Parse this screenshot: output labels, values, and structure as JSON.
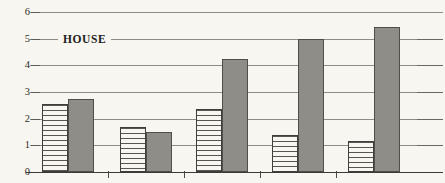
{
  "chart_data": {
    "type": "bar",
    "title": "",
    "subtitle": "",
    "xlabel": "",
    "ylabel": "",
    "ylim": [
      0,
      6
    ],
    "yticks": [
      0,
      1,
      2,
      3,
      4,
      5,
      6
    ],
    "ytick_labels": [
      "0",
      "1",
      "2",
      "3",
      "4",
      "5",
      "6"
    ],
    "grid": true,
    "legend_position": "inline-on-gridline-5",
    "annotations": [
      {
        "text": "HOUSE",
        "x_px": 78,
        "y_value": 5
      }
    ],
    "categories": [
      "1",
      "2",
      "3",
      "4",
      "5"
    ],
    "series": [
      {
        "name": "hatched",
        "pattern": "horizontal-lines",
        "color": "#f8f6f0",
        "values": [
          2.55,
          1.7,
          2.35,
          1.38,
          1.15
        ]
      },
      {
        "name": "solid",
        "pattern": "solid-fill",
        "color": "#8e8d87",
        "values": [
          2.72,
          1.5,
          4.25,
          5.0,
          5.45
        ]
      }
    ]
  },
  "style": {
    "background": "#f8f6f0",
    "gridline_color": "#8e8c85",
    "axis_color": "#3b3a36",
    "bar_outline": "#4a4944",
    "bar_solid_fill": "#8e8d87",
    "hatch_line_color": "#575651",
    "text_color": "#2e2d2a"
  },
  "layout": {
    "plot_left_px": 30,
    "plot_right_px": 443,
    "baseline_y_px": 172,
    "top_y_px": 12,
    "px_per_unit": 26.67,
    "group_starts_px": [
      42,
      120,
      196,
      272,
      348
    ],
    "bar_width_px": 26,
    "bar_gap_px": 0,
    "group_separators_px": [
      108,
      184,
      260,
      336
    ]
  }
}
